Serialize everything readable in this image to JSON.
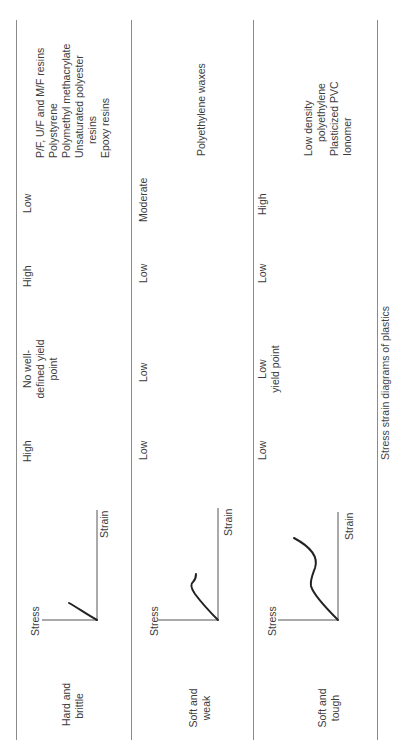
{
  "caption": "Stress strain diagrams of plastics",
  "axis_labels": {
    "stress": "Stress",
    "strain": "Strain"
  },
  "rows": [
    {
      "description": [
        "Hard and",
        "brittle"
      ],
      "modulus": "High",
      "yield_stress": [
        "No well-",
        "defined yield",
        "point"
      ],
      "ultimate_strength": "High",
      "elongation_at_break": "Low",
      "examples": [
        "P/F, U/F and M/F resins",
        "Polystyrene",
        "Polymethyl methacrylate",
        "Unsaturated polyester",
        "resins",
        "Epoxy resins"
      ],
      "curve": "short-linear"
    },
    {
      "description": [
        "Soft and",
        "weak"
      ],
      "modulus": "Low",
      "yield_stress": [
        "Low"
      ],
      "ultimate_strength": "Low",
      "elongation_at_break": "Moderate",
      "examples": [
        "Polyethylene waxes"
      ],
      "curve": "yield-moderate"
    },
    {
      "description": [
        "Soft and",
        "tough"
      ],
      "modulus": "Low",
      "yield_stress": [
        "Low",
        "yield point"
      ],
      "ultimate_strength": "Low",
      "elongation_at_break": "High",
      "examples": [
        "Low density",
        "polyethylene",
        "Plasticized PVC",
        "Ionomer"
      ],
      "curve": "yield-long"
    }
  ]
}
